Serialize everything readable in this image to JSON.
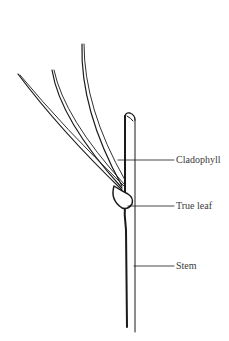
{
  "figure": {
    "labels": [
      {
        "id": "cladophyll",
        "text": "Cladophyll"
      },
      {
        "id": "true-leaf",
        "text": "True leaf"
      },
      {
        "id": "stem",
        "text": "Stem"
      }
    ]
  },
  "colors": {
    "ink": "#1a1a1a",
    "label_text": "#3a3a3a",
    "background": "#ffffff"
  }
}
